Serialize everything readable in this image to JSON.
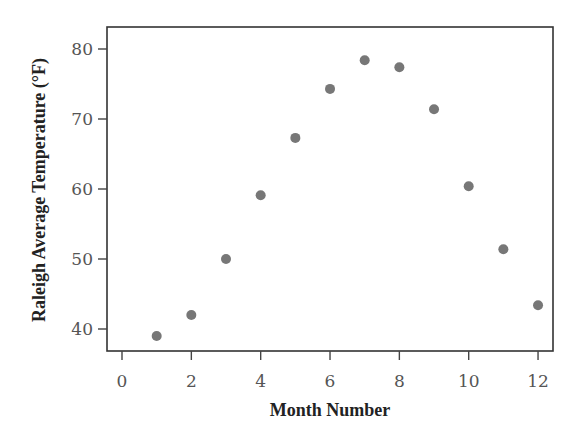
{
  "chart_data": {
    "type": "scatter",
    "title": "",
    "xlabel": "Month Number",
    "ylabel": "Raleigh Average Temperature (°F)",
    "xlim": [
      -1.0,
      12.5
    ],
    "ylim": [
      37,
      83
    ],
    "xticks": [
      0,
      2,
      4,
      6,
      8,
      10,
      12
    ],
    "yticks": [
      40,
      50,
      60,
      70,
      80
    ],
    "grid": false,
    "legend": null,
    "marker_color": "#777777",
    "series": [
      {
        "name": "Raleigh Average Temperature",
        "x": [
          1,
          2,
          3,
          4,
          5,
          6,
          7,
          8,
          9,
          10,
          11,
          12
        ],
        "y": [
          39.0,
          42.0,
          50.0,
          59.1,
          67.3,
          74.3,
          78.4,
          77.4,
          71.4,
          60.4,
          51.4,
          43.4
        ]
      }
    ]
  }
}
